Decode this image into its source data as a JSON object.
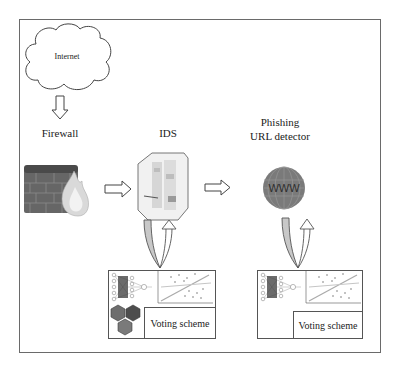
{
  "diagram": {
    "title": "",
    "nodes": {
      "internet": {
        "label": "Internet",
        "icon": "cloud-icon"
      },
      "firewall": {
        "label": "Firewall",
        "icon": "firewall-icon"
      },
      "ids": {
        "label": "IDS",
        "icon": "server-appliance-icon"
      },
      "phishing": {
        "label_line1": "Phishing",
        "label_line2": "URL detector",
        "icon": "www-globe-icon",
        "icon_text": "WWW"
      }
    },
    "panels": {
      "ids_models": {
        "voting_label": "Voting scheme",
        "icons": [
          "neural-network-icon",
          "scatter-plot-icon",
          "hexagon-cluster-icon"
        ]
      },
      "phishing_models": {
        "voting_label": "Voting scheme",
        "icons": [
          "neural-network-icon",
          "scatter-plot-icon"
        ]
      }
    },
    "edges": [
      {
        "from": "internet",
        "to": "firewall",
        "style": "hollow-arrow-down"
      },
      {
        "from": "firewall",
        "to": "ids",
        "style": "hollow-arrow-right"
      },
      {
        "from": "ids",
        "to": "phishing",
        "style": "hollow-arrow-right"
      },
      {
        "from": "ids",
        "to": "ids_models",
        "style": "loop-arrow"
      },
      {
        "from": "phishing",
        "to": "phishing_models",
        "style": "loop-arrow"
      }
    ],
    "colors": {
      "frame": "#6a6a6a",
      "brick": "#5e5e5e",
      "globe": "#7a7a7a",
      "hex": "#6b6b6b",
      "loop_fill": "#c8c8c8"
    }
  }
}
